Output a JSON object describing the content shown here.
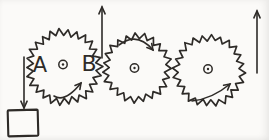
{
  "scene": {
    "kind": "hand-drawn gear train sketch",
    "background": "#fbfaf8",
    "ink": "#2e2b28",
    "width": 269,
    "height": 140
  },
  "gears": [
    {
      "name": "gear-left",
      "cx": 64,
      "cy": 67,
      "r_outer": 38,
      "r_inner": 31.5,
      "teeth": 26,
      "hub": {
        "cx": 63,
        "cy": 64.5,
        "r": 4.2
      },
      "rotation": "counterclockwise",
      "spin_arrow": {
        "x1": 54,
        "y1": 96,
        "cx": 65,
        "cy": 103,
        "x2": 81,
        "y2": 83
      },
      "labels": [
        {
          "text": "A",
          "x": 40,
          "y": 72,
          "size": 21
        },
        {
          "text": "B",
          "x": 89,
          "y": 71,
          "size": 22
        }
      ]
    },
    {
      "name": "gear-middle",
      "cx": 137,
      "cy": 68,
      "r_outer": 34.5,
      "r_inner": 28.5,
      "teeth": 23,
      "hub": {
        "cx": 134.5,
        "cy": 68,
        "r": 4.2
      },
      "rotation": "clockwise",
      "spin_arrow": {
        "x1": 119,
        "y1": 45,
        "cx": 137,
        "cy": 31,
        "x2": 153,
        "y2": 50
      },
      "labels": []
    },
    {
      "name": "gear-right",
      "cx": 209,
      "cy": 70.5,
      "r_outer": 36,
      "r_inner": 30,
      "teeth": 24,
      "hub": {
        "cx": 208,
        "cy": 69,
        "r": 4.2
      },
      "rotation": "counterclockwise",
      "spin_arrow": {
        "x1": 192,
        "y1": 101,
        "cx": 212,
        "cy": 99,
        "x2": 230,
        "y2": 84
      },
      "labels": []
    }
  ],
  "straight_arrows": [
    {
      "name": "mesh-up-arrow",
      "x": 102,
      "y_tail": 58,
      "y_tip": 7,
      "direction": "up"
    },
    {
      "name": "rim-up-arrow",
      "x": 257,
      "y_tail": 73,
      "y_tip": 11,
      "direction": "up"
    },
    {
      "name": "weight-down-arrow",
      "x": 24,
      "y_tail": 57,
      "y_tip": 108,
      "direction": "down"
    }
  ],
  "weight": {
    "name": "hanging-weight-box",
    "x": 8,
    "y": 110,
    "width": 30,
    "height": 26,
    "tilt_deg": -1.5
  }
}
